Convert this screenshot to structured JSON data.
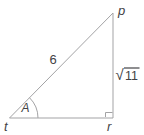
{
  "figure": {
    "vertices": {
      "top_right": "p",
      "bottom_left": "t",
      "bottom_right": "r"
    },
    "angle_at_t": "A",
    "side_labels": {
      "hypotenuse_tp": "6",
      "radical_symbol": "√",
      "side_pr_radicand": "11"
    },
    "colors": {
      "line": "#a3a3a5",
      "text": "#424245",
      "background": "#ffffff"
    }
  }
}
